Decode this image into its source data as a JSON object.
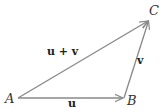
{
  "diagram": {
    "points": [
      {
        "label": "A",
        "x": 18,
        "y": 98,
        "lx": 5,
        "ly": 103
      },
      {
        "label": "B",
        "x": 124,
        "y": 98,
        "lx": 127,
        "ly": 105
      },
      {
        "label": "C",
        "x": 149,
        "y": 20,
        "lx": 149,
        "ly": 15
      }
    ],
    "vectors": [
      {
        "label": "u",
        "from": "A",
        "to": "B",
        "lx": 68,
        "ly": 107
      },
      {
        "label": "v",
        "from": "B",
        "to": "C",
        "lx": 137,
        "ly": 64
      },
      {
        "label": "u + v",
        "from": "A",
        "to": "C",
        "lx": 47,
        "ly": 55
      }
    ],
    "line_color": "#888888"
  }
}
